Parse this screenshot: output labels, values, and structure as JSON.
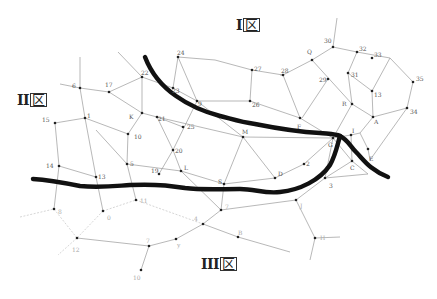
{
  "zones": [
    {
      "id": "I",
      "numeral": "I",
      "char": "区",
      "x": 236,
      "y": 22
    },
    {
      "id": "II",
      "numeral": "II",
      "char": "区",
      "x": 17,
      "y": 97
    },
    {
      "id": "III",
      "numeral": "III",
      "char": "区",
      "x": 201,
      "y": 260
    }
  ],
  "nodes": [
    {
      "id": "6",
      "x": 80,
      "y": 88,
      "lx": 72,
      "ly": 88
    },
    {
      "id": "17",
      "x": 109,
      "y": 92,
      "lx": 105,
      "ly": 87
    },
    {
      "id": "22",
      "x": 142,
      "y": 77,
      "lx": 141,
      "ly": 75
    },
    {
      "id": "24",
      "x": 178,
      "y": 57,
      "lx": 177,
      "ly": 55
    },
    {
      "id": "23",
      "x": 173,
      "y": 88,
      "lx": 172,
      "ly": 93
    },
    {
      "id": "27",
      "x": 252,
      "y": 70,
      "lx": 254,
      "ly": 71
    },
    {
      "id": "28",
      "x": 283,
      "y": 75,
      "lx": 281,
      "ly": 73
    },
    {
      "id": "Q",
      "x": 312,
      "y": 60,
      "lx": 307,
      "ly": 54
    },
    {
      "id": "30",
      "x": 333,
      "y": 47,
      "lx": 324,
      "ly": 43
    },
    {
      "id": "32",
      "x": 357,
      "y": 52,
      "lx": 359,
      "ly": 51
    },
    {
      "id": "29",
      "x": 328,
      "y": 79,
      "lx": 319,
      "ly": 82
    },
    {
      "id": "31",
      "x": 348,
      "y": 73,
      "lx": 351,
      "ly": 77
    },
    {
      "id": "33",
      "x": 372,
      "y": 58,
      "lx": 374,
      "ly": 57
    },
    {
      "id": "35",
      "x": 413,
      "y": 82,
      "lx": 416,
      "ly": 81
    },
    {
      "id": "13r",
      "x": 372,
      "y": 91,
      "lx": 374,
      "ly": 97,
      "label": "13"
    },
    {
      "id": "15",
      "x": 55,
      "y": 123,
      "lx": 42,
      "ly": 122
    },
    {
      "id": "1",
      "x": 85,
      "y": 118,
      "lx": 87,
      "ly": 118
    },
    {
      "id": "K",
      "x": 142,
      "y": 113,
      "lx": 129,
      "ly": 119
    },
    {
      "id": "10",
      "x": 128,
      "y": 134,
      "lx": 134,
      "ly": 139
    },
    {
      "id": "9",
      "x": 197,
      "y": 101,
      "lx": 198,
      "ly": 106
    },
    {
      "id": "26",
      "x": 250,
      "y": 101,
      "lx": 252,
      "ly": 107
    },
    {
      "id": "21",
      "x": 157,
      "y": 117,
      "lx": 158,
      "ly": 121
    },
    {
      "id": "25",
      "x": 183,
      "y": 127,
      "lx": 187,
      "ly": 129
    },
    {
      "id": "M",
      "x": 243,
      "y": 137,
      "lx": 242,
      "ly": 134
    },
    {
      "id": "F",
      "x": 300,
      "y": 118,
      "lx": 297,
      "ly": 129
    },
    {
      "id": "R",
      "x": 352,
      "y": 104,
      "lx": 342,
      "ly": 106
    },
    {
      "id": "A",
      "x": 373,
      "y": 117,
      "lx": 374,
      "ly": 124
    },
    {
      "id": "34",
      "x": 407,
      "y": 108,
      "lx": 410,
      "ly": 114
    },
    {
      "id": "20",
      "x": 173,
      "y": 150,
      "lx": 175,
      "ly": 153
    },
    {
      "id": "G",
      "x": 333,
      "y": 138,
      "lx": 328,
      "ly": 147
    },
    {
      "id": "I",
      "x": 351,
      "y": 135,
      "lx": 352,
      "ly": 133
    },
    {
      "id": "E",
      "x": 368,
      "y": 149,
      "lx": 369,
      "ly": 161
    },
    {
      "id": "C",
      "x": 352,
      "y": 161,
      "lx": 350,
      "ly": 170
    },
    {
      "id": "14",
      "x": 59,
      "y": 166,
      "lx": 46,
      "ly": 168
    },
    {
      "id": "13",
      "x": 96,
      "y": 177,
      "lx": 98,
      "ly": 179
    },
    {
      "id": "5",
      "x": 127,
      "y": 164,
      "lx": 130,
      "ly": 166
    },
    {
      "id": "19",
      "x": 159,
      "y": 174,
      "lx": 151,
      "ly": 173
    },
    {
      "id": "L",
      "x": 181,
      "y": 171,
      "lx": 184,
      "ly": 170
    },
    {
      "id": "S",
      "x": 224,
      "y": 184,
      "lx": 218,
      "ly": 184
    },
    {
      "id": "D",
      "x": 275,
      "y": 178,
      "lx": 278,
      "ly": 176
    },
    {
      "id": "G2",
      "x": 304,
      "y": 164,
      "lx": 306,
      "ly": 166,
      "label": "2"
    },
    {
      "id": "3",
      "x": 325,
      "y": 178,
      "lx": 329,
      "ly": 188
    },
    {
      "id": "11",
      "x": 136,
      "y": 200,
      "lx": 140,
      "ly": 203
    },
    {
      "id": "7",
      "x": 221,
      "y": 210,
      "lx": 225,
      "ly": 209
    },
    {
      "id": "J",
      "x": 296,
      "y": 200,
      "lx": 300,
      "ly": 208
    },
    {
      "id": "8",
      "x": 54,
      "y": 209,
      "lx": 58,
      "ly": 214
    },
    {
      "id": "0",
      "x": 103,
      "y": 211,
      "lx": 107,
      "ly": 220
    },
    {
      "id": "4",
      "x": 203,
      "y": 224,
      "lx": 194,
      "ly": 221
    },
    {
      "id": "B",
      "x": 238,
      "y": 237,
      "lx": 238,
      "ly": 235
    },
    {
      "id": "H",
      "x": 315,
      "y": 238,
      "lx": 320,
      "ly": 240
    },
    {
      "id": "2b",
      "x": 77,
      "y": 238,
      "lx": 72,
      "ly": 252,
      "label": "12"
    },
    {
      "id": "t",
      "x": 149,
      "y": 246,
      "lx": 146,
      "ly": 243,
      "label": "7"
    },
    {
      "id": "y",
      "x": 176,
      "y": 239,
      "lx": 177,
      "ly": 247,
      "label": "y"
    },
    {
      "id": "10b",
      "x": 141,
      "y": 270,
      "lx": 133,
      "ly": 280,
      "label": "10"
    }
  ],
  "labels_display": {
    "6": "6",
    "17": "17",
    "22": "22",
    "24": "24",
    "23": "23",
    "27": "27",
    "28": "28",
    "Q": "Q",
    "30": "30",
    "32": "32",
    "29": "29",
    "31": "31",
    "33": "33",
    "35": "35",
    "15": "15",
    "1": "1",
    "K": "K",
    "10": "10",
    "9": "9",
    "26": "26",
    "21": "21",
    "25": "25",
    "M": "M",
    "F": "F",
    "R": "R",
    "A": "A",
    "34": "34",
    "20": "20",
    "G": "G",
    "I": "I",
    "E": "E",
    "C": "C",
    "14": "14",
    "13": "13",
    "5": "5",
    "19": "19",
    "L": "L",
    "S": "S",
    "D": "D",
    "3": "3",
    "11": "11",
    "7": "7",
    "J": "J",
    "8": "8",
    "0": "0",
    "4": "4",
    "B": "B",
    "H": "H"
  }
}
